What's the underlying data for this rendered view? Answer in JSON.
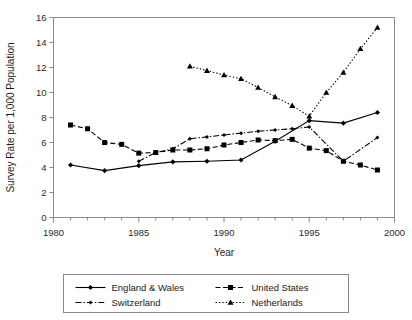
{
  "chart_data": {
    "type": "line",
    "title": "",
    "xlabel": "Year",
    "ylabel": "Survey Rate per 1,000 Population",
    "xlim": [
      1980,
      2000
    ],
    "ylim": [
      0,
      16
    ],
    "xticks": [
      1980,
      1985,
      1990,
      1995,
      2000
    ],
    "yticks": [
      0,
      2,
      4,
      6,
      8,
      10,
      12,
      14,
      16
    ],
    "xtick_labels": [
      "1980",
      "1985",
      "1990",
      "1995",
      "2000"
    ],
    "ytick_labels": [
      "0",
      "2",
      "4",
      "6",
      "8",
      "10",
      "12",
      "14",
      "16"
    ],
    "xminor_step": 1,
    "grid": false,
    "legend_position": "below-plot",
    "series": [
      {
        "name": "England & Wales",
        "marker": "diamond",
        "dash": "solid",
        "x": [
          1981,
          1983,
          1985,
          1987,
          1989,
          1991,
          1993,
          1995,
          1997,
          1999
        ],
        "values": [
          4.2,
          3.75,
          4.15,
          4.45,
          4.5,
          4.6,
          6.1,
          7.75,
          7.55,
          8.4
        ]
      },
      {
        "name": "United States",
        "marker": "square",
        "dash": "dashed",
        "x": [
          1981,
          1982,
          1983,
          1984,
          1985,
          1986,
          1987,
          1988,
          1989,
          1990,
          1991,
          1992,
          1993,
          1994,
          1995,
          1996,
          1997,
          1998,
          1999
        ],
        "values": [
          7.4,
          7.1,
          6.0,
          5.85,
          5.15,
          5.2,
          5.4,
          5.4,
          5.5,
          5.8,
          6.0,
          6.2,
          6.15,
          6.25,
          5.55,
          5.35,
          4.5,
          4.2,
          3.8
        ]
      },
      {
        "name": "Switzerland",
        "marker": "diamond-small",
        "dash": "dash-dot",
        "x": [
          1985,
          1986,
          1987,
          1988,
          1989,
          1990,
          1991,
          1992,
          1993,
          1994,
          1995,
          1997,
          1999
        ],
        "values": [
          4.5,
          5.2,
          5.5,
          6.3,
          6.45,
          6.6,
          6.75,
          6.9,
          7.0,
          7.1,
          7.25,
          4.5,
          6.4
        ]
      },
      {
        "name": "Netherlands",
        "marker": "triangle",
        "dash": "dotted",
        "x": [
          1988,
          1989,
          1990,
          1991,
          1992,
          1993,
          1994,
          1995,
          1996,
          1997,
          1998,
          1999
        ],
        "values": [
          12.1,
          11.75,
          11.4,
          11.1,
          10.4,
          9.65,
          8.95,
          8.1,
          10.0,
          11.6,
          13.5,
          15.2
        ]
      }
    ]
  },
  "legend": {
    "items": [
      {
        "label": "England & Wales"
      },
      {
        "label": "United States"
      },
      {
        "label": "Switzerland"
      },
      {
        "label": "Netherlands"
      }
    ]
  }
}
